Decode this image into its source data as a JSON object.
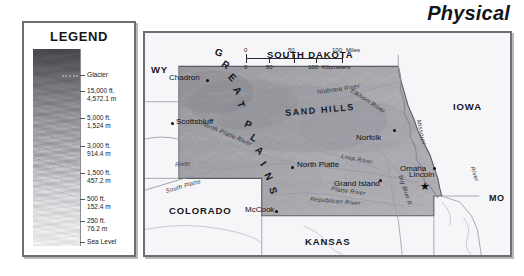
{
  "page": {
    "title": "Physical",
    "background_color": "#ffffff",
    "frame_color": "#6e6e74"
  },
  "legend": {
    "title": "LEGEND",
    "swatch_name": "elevation-relief-gradient",
    "glacier_label": "Glacier",
    "entries": [
      {
        "feet": "15,000 ft.",
        "meters": "4,572.1 m"
      },
      {
        "feet": "5,000 ft.",
        "meters": "1,524 m"
      },
      {
        "feet": "3,000 ft.",
        "meters": "914.4 m"
      },
      {
        "feet": "1,500 ft.",
        "meters": "457.2 m"
      },
      {
        "feet": "500 ft.",
        "meters": "152.4 m"
      },
      {
        "feet": "250 ft.",
        "meters": "76.2 m"
      },
      {
        "feet": "Sea Level",
        "meters": ""
      }
    ]
  },
  "scale_bar": {
    "miles_ticks": [
      "0",
      "50",
      "100"
    ],
    "miles_unit": "Miles",
    "km_ticks": [
      "0",
      "50",
      "100"
    ],
    "km_unit": "Kilometers"
  },
  "map": {
    "states": [
      {
        "name": "WY",
        "full": "Wyoming"
      },
      {
        "name": "SOUTH DAKOTA",
        "full": "South Dakota"
      },
      {
        "name": "IOWA",
        "full": "Iowa"
      },
      {
        "name": "MO",
        "full": "Missouri"
      },
      {
        "name": "KANSAS",
        "full": "Kansas"
      },
      {
        "name": "COLORADO",
        "full": "Colorado"
      }
    ],
    "regions": [
      {
        "name": "GREAT"
      },
      {
        "name": "PLAINS"
      },
      {
        "name": "SAND HILLS"
      }
    ],
    "cities": [
      {
        "name": "Chadron",
        "capital": false
      },
      {
        "name": "Scottsbluff",
        "capital": false
      },
      {
        "name": "North Platte",
        "capital": false
      },
      {
        "name": "Norfolk",
        "capital": false
      },
      {
        "name": "Grand Island",
        "capital": false
      },
      {
        "name": "Omaha",
        "capital": false
      },
      {
        "name": "Lincoln",
        "capital": true
      },
      {
        "name": "McCook",
        "capital": false
      }
    ],
    "rivers": [
      {
        "name": "Niobrara River"
      },
      {
        "name": "North Platte River"
      },
      {
        "name": "South Platte"
      },
      {
        "name": "Platte River"
      },
      {
        "name": "Elkhorn River"
      },
      {
        "name": "Loup River"
      },
      {
        "name": "Republican River"
      },
      {
        "name": "Missouri"
      },
      {
        "name": "Big Blue R."
      },
      {
        "name": "River"
      }
    ]
  }
}
